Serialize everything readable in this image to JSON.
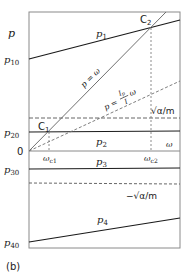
{
  "figure": {
    "panel_label": "(b)",
    "axis": {
      "y_label": "p",
      "x_label": "ω",
      "origin_label": "0"
    },
    "y_ticks": {
      "p10": "p",
      "p10_sub": "10",
      "p20": "p",
      "p20_sub": "20",
      "p30": "p",
      "p30_sub": "30",
      "p40": "p",
      "p40_sub": "40"
    },
    "curves": {
      "p1": {
        "name": "p",
        "sub": "1"
      },
      "p2": {
        "name": "p",
        "sub": "2"
      },
      "p3": {
        "name": "p",
        "sub": "3"
      },
      "p4": {
        "name": "p",
        "sub": "4"
      }
    },
    "lines": {
      "p_eq_omega": "p = ω",
      "p_eq_ratio_prefix": "p =",
      "p_eq_ratio_num": "I",
      "p_eq_ratio_num_sub": "p",
      "p_eq_ratio_den": "I",
      "p_eq_ratio_suffix": "ω",
      "sqrt_pos": "√α/m",
      "sqrt_neg": "−√α/m"
    },
    "points": {
      "c1": "C",
      "c1_sub": "1",
      "c2": "C",
      "c2_sub": "2"
    },
    "x_ticks": {
      "wc1": "ω",
      "wc1_sub": "c1",
      "wc2": "ω",
      "wc2_sub": "c2"
    },
    "colors": {
      "frame": "#8a8a8a",
      "curve": "#1a1a1a",
      "diag": "#707070",
      "dash": "#555555"
    }
  }
}
